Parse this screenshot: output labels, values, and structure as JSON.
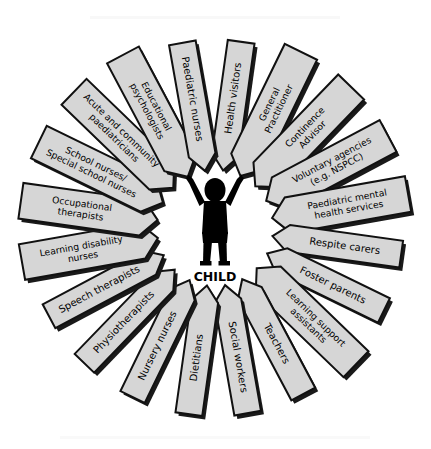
{
  "diagram": {
    "type": "radial-arrow-wheel",
    "center": {
      "label": "CHILD",
      "icon": "child-silhouette-arms-raised"
    },
    "colors": {
      "arrow_fill": "#d6d6d6",
      "arrow_stroke": "#111111",
      "arrow_shadow": "#1a1a1a",
      "text": "#000000",
      "background": "#ffffff"
    },
    "arrow_count": 20,
    "arrows": [
      {
        "index": 0,
        "label": "Health visitors",
        "lines": [
          "Health visitors"
        ],
        "angle": -82
      },
      {
        "index": 1,
        "label": "General Practitioner",
        "lines": [
          "General",
          "Practitioner"
        ],
        "angle": -64
      },
      {
        "index": 2,
        "label": "Continence Advisor",
        "lines": [
          "Continence",
          "Advisor"
        ],
        "angle": -46
      },
      {
        "index": 3,
        "label": "Voluntary agencies (e.g. NSPCC)",
        "lines": [
          "Voluntary agencies",
          "(e.g. NSPCC)"
        ],
        "angle": -28
      },
      {
        "index": 4,
        "label": "Paediatric mental health services",
        "lines": [
          "Paediatric mental",
          "health services"
        ],
        "angle": -10
      },
      {
        "index": 5,
        "label": "Respite carers",
        "lines": [
          "Respite carers"
        ],
        "angle": 8
      },
      {
        "index": 6,
        "label": "Foster parents",
        "lines": [
          "Foster parents"
        ],
        "angle": 26
      },
      {
        "index": 7,
        "label": "Learning support assistants",
        "lines": [
          "Learning support",
          "assistants"
        ],
        "angle": 44
      },
      {
        "index": 8,
        "label": "Teachers",
        "lines": [
          "Teachers"
        ],
        "angle": 62
      },
      {
        "index": 9,
        "label": "Social workers",
        "lines": [
          "Social workers"
        ],
        "angle": 80
      },
      {
        "index": 10,
        "label": "Dietitians",
        "lines": [
          "Dietitians"
        ],
        "angle": 98
      },
      {
        "index": 11,
        "label": "Nursery nurses",
        "lines": [
          "Nursery nurses"
        ],
        "angle": 116
      },
      {
        "index": 12,
        "label": "Physiotherapists",
        "lines": [
          "Physiotherapists"
        ],
        "angle": 134
      },
      {
        "index": 13,
        "label": "Speech therapists",
        "lines": [
          "Speech therapists"
        ],
        "angle": 152
      },
      {
        "index": 14,
        "label": "Learning disability nurses",
        "lines": [
          "Learning disability",
          "nurses"
        ],
        "angle": 170
      },
      {
        "index": 15,
        "label": "Occupational therapists",
        "lines": [
          "Occupational",
          "therapists"
        ],
        "angle": 188
      },
      {
        "index": 16,
        "label": "School nurses/ Special school nurses",
        "lines": [
          "School nurses/",
          "Special school nurses"
        ],
        "angle": 206
      },
      {
        "index": 17,
        "label": "Acute and community paediatricians",
        "lines": [
          "Acute and community",
          "paediatricians"
        ],
        "angle": 224
      },
      {
        "index": 18,
        "label": "Educational psychologists",
        "lines": [
          "Educational",
          "psychologists"
        ],
        "angle": 242
      },
      {
        "index": 19,
        "label": "Paediatric nurses",
        "lines": [
          "Paediatric nurses"
        ],
        "angle": 260
      }
    ]
  }
}
